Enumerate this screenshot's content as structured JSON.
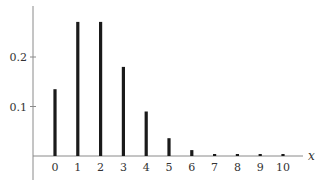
{
  "chart_data": {
    "type": "bar",
    "title": "",
    "xlabel": "x",
    "ylabel": "",
    "categories": [
      "0",
      "1",
      "2",
      "3",
      "4",
      "5",
      "6",
      "7",
      "8",
      "9",
      "10"
    ],
    "values": [
      0.135,
      0.271,
      0.271,
      0.18,
      0.09,
      0.036,
      0.012,
      0.003,
      0.001,
      0.0002,
      4e-05
    ],
    "yticks": [
      "0.1",
      "0.2"
    ],
    "ytick_values": [
      0.1,
      0.2
    ],
    "ylim": [
      -0.08,
      0.3
    ],
    "xlim": [
      -1,
      11.2
    ],
    "grid": false,
    "legend": null,
    "style": {
      "bar_color": "#1a1a1a",
      "axis_color": "#888888",
      "text_color": "#333333"
    }
  }
}
